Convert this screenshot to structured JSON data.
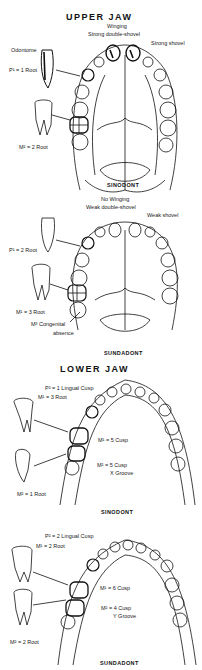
{
  "upper_jaw": {
    "title": "UPPER JAW",
    "sinodont": {
      "caption": "SINODONT",
      "labels": {
        "winging": "Winging",
        "double_shovel": "Strong double-shovel",
        "shovel": "Strong shovel",
        "odontome": "Odontome",
        "p1": "P¹ = 1 Root",
        "m2": "M² = 2 Root"
      }
    },
    "sundadont": {
      "caption": "SUNDADONT",
      "labels": {
        "winging": "No Winging",
        "double_shovel": "Weak double-shovel",
        "shovel": "Weak shovel",
        "p1": "P¹ = 2 Root",
        "m1": "M¹ = 3 Root",
        "m3a": "M³ Congenital",
        "m3b": "absence"
      }
    }
  },
  "lower_jaw": {
    "title": "LOWER JAW",
    "sinodont": {
      "caption": "SINODONT",
      "labels": {
        "p2": "P² = 1 Lingual Cusp",
        "m1_root": "M¹ = 3 Root",
        "m1_cusp": "M¹ = 5 Cusp",
        "m2_cusp": "M² = 5 Cusp",
        "groove": "X Groove",
        "m2_root": "M² = 1 Root"
      }
    },
    "sundadont": {
      "caption": "SUNDADONT",
      "labels": {
        "p2": "P² = 2 Lingual Cusp",
        "m1_root": "M¹ = 2 Root",
        "m1_cusp": "M¹ = 6 Cusp",
        "m2_cusp": "M² = 4 Cusp",
        "groove": "Y Groove",
        "m2_root": "M² = 2 Root"
      }
    }
  }
}
